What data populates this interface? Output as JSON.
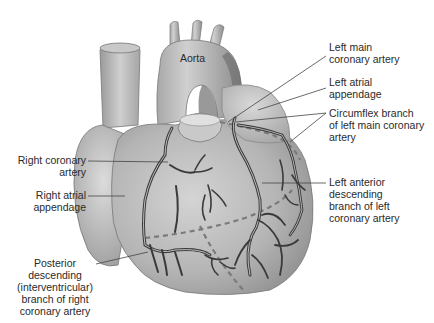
{
  "diagram": {
    "labels": {
      "aorta": "Aorta",
      "left_main_coronary": "Left main\ncoronary artery",
      "left_atrial_appendage": "Left atrial\nappendage",
      "circumflex": "Circumflex branch\nof left main coronary\nartery",
      "left_anterior_descending": "Left anterior\ndescending\nbranch of left\ncoronary artery",
      "right_coronary": "Right coronary\nartery",
      "right_atrial_appendage": "Right atrial\nappendage",
      "posterior_descending": "Posterior\ndescending\n(interventricular)\nbranch of right\ncoronary artery"
    },
    "colors": {
      "background": "#ffffff",
      "heart_fill": "#b8b8b8",
      "heart_shadow": "#8a8a8a",
      "artery": "#3c3c3c",
      "leader_line": "#444444",
      "dashed_line": "#777777",
      "text": "#2a2a2a"
    }
  }
}
